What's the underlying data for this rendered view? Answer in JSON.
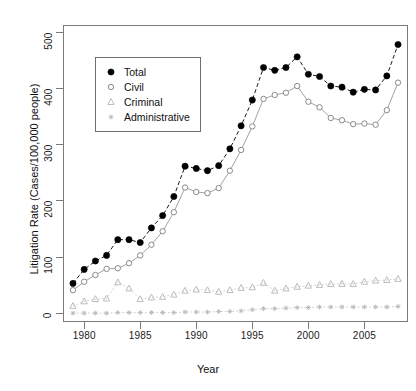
{
  "chart_data": {
    "type": "line",
    "title": "",
    "xlabel": "Year",
    "ylabel": "Litigation Rate (Cases/100,000 people)",
    "xlim": [
      1978.2,
      2008.8
    ],
    "ylim": [
      -14,
      512
    ],
    "xticks": [
      1980,
      1985,
      1990,
      1995,
      2000,
      2005
    ],
    "yticks": [
      0,
      100,
      200,
      300,
      400,
      500
    ],
    "grid": false,
    "legend_position": "top-left",
    "x": [
      1979,
      1980,
      1981,
      1982,
      1983,
      1984,
      1985,
      1986,
      1987,
      1988,
      1989,
      1990,
      1991,
      1992,
      1993,
      1994,
      1995,
      1996,
      1997,
      1998,
      1999,
      2000,
      2001,
      2002,
      2003,
      2004,
      2005,
      2006,
      2007,
      2008
    ],
    "series": [
      {
        "name": "Total",
        "marker": "filled-circle",
        "linestyle": "dashed",
        "color": "#000000",
        "values": [
          53,
          78,
          93,
          103,
          131,
          131,
          126,
          152,
          174,
          208,
          262,
          258,
          254,
          263,
          293,
          334,
          380,
          438,
          433,
          438,
          457,
          426,
          422,
          405,
          403,
          394,
          399,
          398,
          423,
          479
        ]
      },
      {
        "name": "Civil",
        "marker": "open-circle",
        "linestyle": "solid",
        "color": "#8a8a8a",
        "values": [
          41,
          56,
          68,
          79,
          80,
          89,
          103,
          122,
          146,
          180,
          224,
          216,
          214,
          223,
          254,
          291,
          333,
          382,
          389,
          393,
          405,
          377,
          367,
          348,
          344,
          337,
          338,
          336,
          362,
          411
        ]
      },
      {
        "name": "Criminal",
        "marker": "triangle",
        "linestyle": "dotted",
        "color": "#bdbdbd",
        "values": [
          13,
          21,
          25,
          26,
          55,
          44,
          25,
          28,
          29,
          33,
          40,
          42,
          41,
          38,
          41,
          45,
          46,
          54,
          40,
          44,
          47,
          49,
          50,
          52,
          52,
          52,
          56,
          58,
          59,
          61
        ]
      },
      {
        "name": "Administrative",
        "marker": "plus-star",
        "linestyle": "dotted",
        "color": "#bdbdbd",
        "values": [
          0,
          0,
          0,
          0,
          1,
          1,
          1,
          1,
          1,
          1,
          2,
          2,
          2,
          3,
          3,
          4,
          6,
          8,
          8,
          9,
          10,
          10,
          11,
          11,
          11,
          11,
          11,
          11,
          11,
          12
        ]
      }
    ]
  },
  "axes": {
    "y_title": "Litigation Rate (Cases/100,000 people)",
    "x_title": "Year",
    "y_tick_labels": [
      "0",
      "100",
      "200",
      "300",
      "400",
      "500"
    ],
    "x_tick_labels": [
      "1980",
      "1985",
      "1990",
      "1995",
      "2000",
      "2005"
    ]
  },
  "legend": {
    "items": [
      {
        "label": "Total",
        "symbol": "filled-circle"
      },
      {
        "label": "Civil",
        "symbol": "open-circle"
      },
      {
        "label": "Criminal",
        "symbol": "triangle"
      },
      {
        "label": "Administrative",
        "symbol": "plus-star"
      }
    ]
  },
  "colors": {
    "total": "#000000",
    "civil": "#8a8a8a",
    "criminal": "#bdbdbd",
    "administrative": "#bdbdbd",
    "frame": "#7b7b7b"
  }
}
